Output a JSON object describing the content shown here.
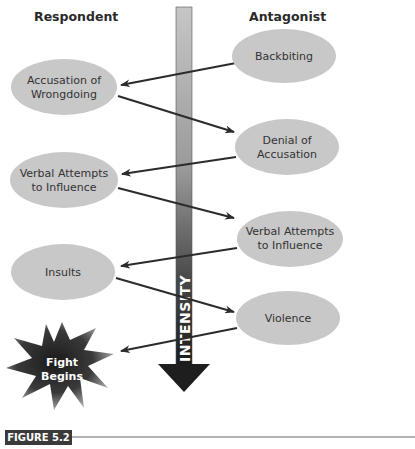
{
  "headers": {
    "respondent": "Respondent",
    "antagonist": "Antagonist"
  },
  "axis": {
    "label": "INTENSITY",
    "direction": "down"
  },
  "nodes": {
    "backbiting": {
      "lines": [
        "Backbiting"
      ],
      "side": "antagonist"
    },
    "accusation": {
      "lines": [
        "Accusation of",
        "Wrongdoing"
      ],
      "side": "respondent"
    },
    "denial": {
      "lines": [
        "Denial of",
        "Accusation"
      ],
      "side": "antagonist"
    },
    "verbal_left": {
      "lines": [
        "Verbal Attempts",
        "to Influence"
      ],
      "side": "respondent"
    },
    "verbal_right": {
      "lines": [
        "Verbal Attempts",
        "to Influence"
      ],
      "side": "antagonist"
    },
    "insults": {
      "lines": [
        "Insults"
      ],
      "side": "respondent"
    },
    "violence": {
      "lines": [
        "Violence"
      ],
      "side": "antagonist"
    },
    "fight": {
      "lines": [
        "Fight",
        "Begins"
      ],
      "side": "respondent"
    }
  },
  "flow": [
    {
      "from": "Backbiting",
      "to": "Accusation of Wrongdoing"
    },
    {
      "from": "Accusation of Wrongdoing",
      "to": "Denial of Accusation"
    },
    {
      "from": "Denial of Accusation",
      "to": "Verbal Attempts to Influence (Respondent)"
    },
    {
      "from": "Verbal Attempts to Influence (Respondent)",
      "to": "Verbal Attempts to Influence (Antagonist)"
    },
    {
      "from": "Verbal Attempts to Influence (Antagonist)",
      "to": "Insults"
    },
    {
      "from": "Insults",
      "to": "Violence"
    },
    {
      "from": "Violence",
      "to": "Fight Begins"
    }
  ],
  "figure": {
    "label": "FIGURE 5.2"
  },
  "colors": {
    "ellipse_fill": "#c8c8c8",
    "arrow_line": "#2b2b2b",
    "shaft_top": "#c4c4c4",
    "shaft_bottom": "#1e1e1e",
    "figure_label_bg": "#3a3a3a",
    "rule_line": "#666666"
  }
}
